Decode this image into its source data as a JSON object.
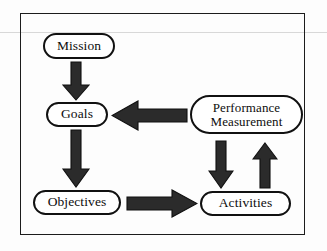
{
  "figure": {
    "frame_color": "#1c1c1c",
    "node_fill": "#ffffff",
    "node_border_color": "#111111",
    "arrow_fill": "#2b2b2b",
    "background": "#fdfdfd"
  },
  "nodes": [
    {
      "id": "mission",
      "label": "Mission"
    },
    {
      "id": "goals",
      "label": "Goals"
    },
    {
      "id": "objectives",
      "label": "Objectives"
    },
    {
      "id": "performance",
      "label_line1": "Performance",
      "label_line2": "Measurement"
    },
    {
      "id": "activities",
      "label": "Activities"
    }
  ],
  "arrows": [
    {
      "id": "mission-goals",
      "from": "Mission",
      "to": "Goals",
      "direction": "down"
    },
    {
      "id": "goals-objectives",
      "from": "Goals",
      "to": "Objectives",
      "direction": "down"
    },
    {
      "id": "performance-goals",
      "from": "Performance Measurement",
      "to": "Goals",
      "direction": "left"
    },
    {
      "id": "objectives-activities",
      "from": "Objectives",
      "to": "Activities",
      "direction": "right"
    },
    {
      "id": "performance-activities",
      "from": "Performance Measurement",
      "to": "Activities",
      "direction": "down"
    },
    {
      "id": "activities-performance",
      "from": "Activities",
      "to": "Performance Measurement",
      "direction": "up"
    }
  ]
}
